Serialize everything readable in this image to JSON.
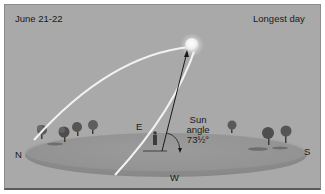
{
  "diagram": {
    "date_label": "June 21-22",
    "title_label": "Longest day",
    "directions": {
      "north": "N",
      "south": "S",
      "east": "E",
      "west": "W"
    },
    "sun_angle": {
      "line1": "Sun",
      "line2": "angle",
      "value": "73½°"
    },
    "elements": [
      "sun",
      "sun-path-arc",
      "ground-disc",
      "trees",
      "observer",
      "angle-arrow"
    ],
    "colors": {
      "background": "#a9a9a9",
      "ground": "#8f8f8f",
      "sun_path": "#f2f2f2",
      "text": "#1a1a1a"
    }
  }
}
